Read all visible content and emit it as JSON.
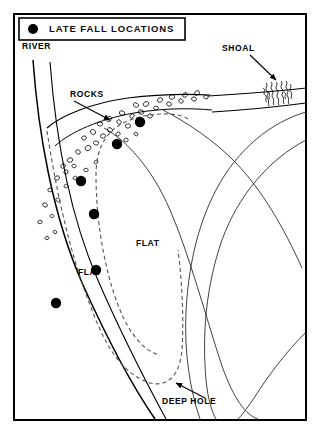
{
  "diagram": {
    "kind": "bathymetric-fishing-map",
    "background_color": "#ffffff",
    "ink_color": "#000000",
    "frame": {
      "x": 14,
      "y": 14,
      "width": 292,
      "height": 406,
      "stroke_width": 2
    }
  },
  "legend": {
    "box": {
      "x": 19,
      "y": 18,
      "width": 166,
      "height": 22
    },
    "marker_icon": "filled-circle-marker",
    "marker_color": "#000000",
    "title": "LATE FALL LOCATIONS"
  },
  "labels": {
    "river": "RIVER",
    "rocks": "ROCKS",
    "shoal": "SHOAL",
    "flat_inner": "FLAT",
    "flat_outer": "FLAT",
    "deep_hole": "DEEP HOLE"
  },
  "label_positions": {
    "river": {
      "x": 22,
      "y": 49,
      "anchor": "start",
      "size": 8.5
    },
    "rocks": {
      "x": 70,
      "y": 97,
      "anchor": "start",
      "size": 8.5
    },
    "shoal": {
      "x": 222,
      "y": 51,
      "anchor": "start",
      "size": 8.5
    },
    "flat_inner": {
      "x": 78,
      "y": 275,
      "anchor": "start",
      "size": 8.5
    },
    "flat_outer": {
      "x": 136,
      "y": 246,
      "anchor": "start",
      "size": 8.5
    },
    "deep_hole": {
      "x": 162,
      "y": 404,
      "anchor": "start",
      "size": 8.5
    }
  },
  "leader_arrows": [
    {
      "name": "rocks-arrow",
      "x1": 74,
      "y1": 101,
      "x2": 110,
      "y2": 120
    },
    {
      "name": "shoal-arrow",
      "x1": 250,
      "y1": 55,
      "x2": 276,
      "y2": 80
    },
    {
      "name": "deep-hole-arrow",
      "x1": 205,
      "y1": 398,
      "x2": 176,
      "y2": 383
    }
  ],
  "shoreline": {
    "name": "river-bank-shoreline",
    "path": "M 33,60 C 38,130 52,215 83,285 C 110,345 135,390 155,419"
  },
  "bank_inner_edge": {
    "name": "inner-bank-edge",
    "path": "M 50,62 C 55,128 68,210 97,278 C 122,336 146,382 166,419"
  },
  "rock_band": {
    "name": "rocky-shore-band",
    "outer_path": "M 47,128 C 62,115 92,103 128,98 C 160,94 188,94 210,95",
    "inner_path": "M 55,146 C 70,132 100,119 134,113 C 164,108 190,108 212,110"
  },
  "shoal_patch": {
    "name": "shoal-hatch-patch",
    "x": 262,
    "y": 80,
    "width": 30,
    "height": 32,
    "upper_edge": "M 208,96 C 240,94 272,92 306,88",
    "lower_edge": "M 212,112 C 244,110 276,107 306,103"
  },
  "dashed_contour": {
    "name": "depth-contour-dashed",
    "stroke_dasharray": "4 3",
    "outer_path": "M 47,131 C 56,190 70,255 92,310 C 106,348 124,375 150,383 C 170,388 180,372 182,350 C 184,320 182,280 178,250",
    "inner_path": "M 188,119 C 178,112 152,112 130,120 C 108,128 96,146 96,175 C 96,220 104,268 118,305 C 128,332 144,352 160,355"
  },
  "depth_contours": [
    {
      "name": "contour-line-1",
      "path": "M 104,128 C 126,140 152,168 170,210 C 190,256 206,318 222,366 C 234,400 246,415 258,419"
    },
    {
      "name": "contour-line-2",
      "path": "M 163,110 C 186,122 214,140 236,163 C 262,190 284,228 302,268"
    },
    {
      "name": "contour-line-3",
      "path": "M 306,112 C 272,122 238,148 216,190 C 196,228 188,272 186,312 C 184,352 190,390 200,419"
    },
    {
      "name": "contour-line-4",
      "path": "M 306,140 C 268,160 238,196 222,240 C 206,286 202,334 206,380 C 208,400 212,412 216,419"
    },
    {
      "name": "contour-line-5",
      "path": "M 306,332 C 286,352 268,376 254,398 C 246,410 241,416 238,419"
    }
  ],
  "location_markers": {
    "name": "late-fall-location-dots",
    "radius": 5.2,
    "color": "#000000",
    "points": [
      {
        "id": 1,
        "x": 140,
        "y": 122
      },
      {
        "id": 2,
        "x": 117,
        "y": 144
      },
      {
        "id": 3,
        "x": 81,
        "y": 181
      },
      {
        "id": 4,
        "x": 94,
        "y": 214
      },
      {
        "id": 5,
        "x": 96,
        "y": 270
      },
      {
        "id": 6,
        "x": 56,
        "y": 303
      }
    ]
  },
  "rock_stones": {
    "name": "scattered-rock-symbols",
    "stones": [
      {
        "x": 57,
        "y": 178,
        "rx": 2.6,
        "ry": 2.0,
        "rot": -28
      },
      {
        "x": 50,
        "y": 190,
        "rx": 2.2,
        "ry": 1.8,
        "rot": 14
      },
      {
        "x": 63,
        "y": 166,
        "rx": 2.4,
        "ry": 2.1,
        "rot": -40
      },
      {
        "x": 45,
        "y": 205,
        "rx": 2.5,
        "ry": 1.9,
        "rot": 30
      },
      {
        "x": 40,
        "y": 222,
        "rx": 2.2,
        "ry": 1.7,
        "rot": -12
      },
      {
        "x": 52,
        "y": 216,
        "rx": 2.0,
        "ry": 1.6,
        "rot": 22
      },
      {
        "x": 70,
        "y": 160,
        "rx": 2.8,
        "ry": 2.2,
        "rot": -18
      },
      {
        "x": 78,
        "y": 152,
        "rx": 2.5,
        "ry": 2.0,
        "rot": 36
      },
      {
        "x": 88,
        "y": 148,
        "rx": 3.0,
        "ry": 2.4,
        "rot": -30
      },
      {
        "x": 96,
        "y": 143,
        "rx": 2.6,
        "ry": 2.0,
        "rot": 10
      },
      {
        "x": 66,
        "y": 172,
        "rx": 2.3,
        "ry": 1.9,
        "rot": -50
      },
      {
        "x": 74,
        "y": 166,
        "rx": 2.1,
        "ry": 1.7,
        "rot": 18
      },
      {
        "x": 84,
        "y": 138,
        "rx": 2.4,
        "ry": 2.0,
        "rot": -22
      },
      {
        "x": 93,
        "y": 132,
        "rx": 2.8,
        "ry": 2.3,
        "rot": 40
      },
      {
        "x": 103,
        "y": 136,
        "rx": 2.5,
        "ry": 2.1,
        "rot": -15
      },
      {
        "x": 110,
        "y": 130,
        "rx": 2.7,
        "ry": 2.2,
        "rot": 25
      },
      {
        "x": 118,
        "y": 134,
        "rx": 2.3,
        "ry": 1.9,
        "rot": -35
      },
      {
        "x": 100,
        "y": 124,
        "rx": 2.6,
        "ry": 2.1,
        "rot": 12
      },
      {
        "x": 109,
        "y": 119,
        "rx": 2.9,
        "ry": 2.3,
        "rot": -28
      },
      {
        "x": 119,
        "y": 122,
        "rx": 2.4,
        "ry": 2.0,
        "rot": 44
      },
      {
        "x": 128,
        "y": 126,
        "rx": 2.6,
        "ry": 2.1,
        "rot": -10
      },
      {
        "x": 122,
        "y": 113,
        "rx": 2.7,
        "ry": 2.2,
        "rot": 20
      },
      {
        "x": 132,
        "y": 116,
        "rx": 2.4,
        "ry": 1.9,
        "rot": -42
      },
      {
        "x": 141,
        "y": 112,
        "rx": 2.8,
        "ry": 2.2,
        "rot": 16
      },
      {
        "x": 150,
        "y": 116,
        "rx": 2.5,
        "ry": 2.0,
        "rot": -20
      },
      {
        "x": 136,
        "y": 105,
        "rx": 2.6,
        "ry": 2.1,
        "rot": 32
      },
      {
        "x": 146,
        "y": 104,
        "rx": 2.9,
        "ry": 2.3,
        "rot": -26
      },
      {
        "x": 156,
        "y": 108,
        "rx": 2.4,
        "ry": 1.9,
        "rot": 8
      },
      {
        "x": 160,
        "y": 100,
        "rx": 2.7,
        "ry": 2.2,
        "rot": -38
      },
      {
        "x": 169,
        "y": 104,
        "rx": 2.5,
        "ry": 2.0,
        "rot": 28
      },
      {
        "x": 172,
        "y": 97,
        "rx": 2.8,
        "ry": 2.2,
        "rot": -14
      },
      {
        "x": 181,
        "y": 101,
        "rx": 2.4,
        "ry": 1.9,
        "rot": 38
      },
      {
        "x": 185,
        "y": 95,
        "rx": 2.6,
        "ry": 2.1,
        "rot": -30
      },
      {
        "x": 194,
        "y": 99,
        "rx": 2.5,
        "ry": 2.0,
        "rot": 18
      },
      {
        "x": 197,
        "y": 93,
        "rx": 2.7,
        "ry": 2.1,
        "rot": -44
      },
      {
        "x": 206,
        "y": 97,
        "rx": 2.3,
        "ry": 1.8,
        "rot": 24
      },
      {
        "x": 126,
        "y": 140,
        "rx": 2.2,
        "ry": 1.8,
        "rot": -16
      },
      {
        "x": 136,
        "y": 134,
        "rx": 2.0,
        "ry": 1.6,
        "rot": 34
      },
      {
        "x": 66,
        "y": 186,
        "rx": 2.1,
        "ry": 1.7,
        "rot": -24
      },
      {
        "x": 58,
        "y": 200,
        "rx": 2.3,
        "ry": 1.8,
        "rot": 42
      },
      {
        "x": 47,
        "y": 238,
        "rx": 2.0,
        "ry": 1.6,
        "rot": -18
      },
      {
        "x": 55,
        "y": 232,
        "rx": 1.9,
        "ry": 1.5,
        "rot": 26
      },
      {
        "x": 75,
        "y": 178,
        "rx": 2.0,
        "ry": 1.6,
        "rot": -34
      },
      {
        "x": 86,
        "y": 170,
        "rx": 2.2,
        "ry": 1.7,
        "rot": 14
      },
      {
        "x": 96,
        "y": 162,
        "rx": 2.1,
        "ry": 1.7,
        "rot": -46
      }
    ]
  },
  "shoal_hatches": {
    "name": "shoal-hatch-strokes",
    "strokes": [
      "M 266,83 c 3,3 -2,5 1,8 c 3,3 -2,5 1,8 c 2,3 -1,5 1,7",
      "M 271,82 c 3,3 -2,5 1,8 c 3,3 -2,5 1,8 c 2,3 -1,5 1,7",
      "M 276,82 c 3,3 -2,5 1,8 c 3,3 -2,5 1,8 c 2,3 -1,5 1,7",
      "M 281,81 c 3,3 -2,5 1,8 c 3,3 -2,5 1,8 c 2,3 -1,5 1,7",
      "M 286,81 c 3,3 -2,5 1,8 c 3,3 -2,5 1,8 c 2,3 -1,5 1,7",
      "M 263,88 c 4,2 -1,5 2,7 c 3,2 -1,5 2,7",
      "M 290,84 c 3,3 -2,5 1,8 c 2,3 -1,5 1,7",
      "M 268,92 c 4,2 -1,5 2,7",
      "M 284,92 c 4,2 -1,5 2,7"
    ]
  }
}
